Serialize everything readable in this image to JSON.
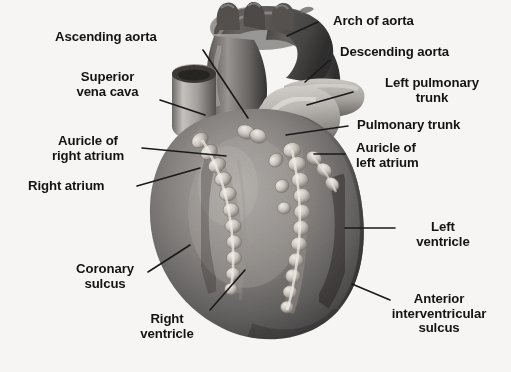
{
  "figure": {
    "style": "grayscale halftone anatomical illustration",
    "background_color": "#f6f5f3",
    "label_color": "#141414",
    "leader_line_color": "#1a1a1a"
  },
  "labels": [
    {
      "id": "ascending-aorta",
      "text": "Ascending aorta",
      "align": "left"
    },
    {
      "id": "superior-vena-cava",
      "text": "Superior\nvena cava",
      "align": "center"
    },
    {
      "id": "auricle-right-atrium",
      "text": "Auricle of\nright atrium",
      "align": "center"
    },
    {
      "id": "right-atrium",
      "text": "Right atrium",
      "align": "left"
    },
    {
      "id": "coronary-sulcus",
      "text": "Coronary\nsulcus",
      "align": "center"
    },
    {
      "id": "right-ventricle",
      "text": "Right\nventricle",
      "align": "center"
    },
    {
      "id": "arch-of-aorta",
      "text": "Arch of aorta",
      "align": "left"
    },
    {
      "id": "descending-aorta",
      "text": "Descending aorta",
      "align": "left"
    },
    {
      "id": "left-pulmonary-trunk",
      "text": "Left pulmonary\ntrunk",
      "align": "center"
    },
    {
      "id": "pulmonary-trunk",
      "text": "Pulmonary trunk",
      "align": "left"
    },
    {
      "id": "auricle-left-atrium",
      "text": "Auricle of\nleft atrium",
      "align": "left"
    },
    {
      "id": "left-ventricle",
      "text": "Left\nventricle",
      "align": "center"
    },
    {
      "id": "anterior-interventricular-sulcus",
      "text": "Anterior\ninterventricular\nsulcus",
      "align": "center"
    }
  ],
  "structures": [
    "aortic-arch",
    "brachiocephalic-branches",
    "ascending-aorta",
    "descending-aorta",
    "superior-vena-cava",
    "pulmonary-trunk",
    "left-pulmonary-artery",
    "right-atrium",
    "right-auricle",
    "left-auricle",
    "right-ventricle",
    "left-ventricle",
    "coronary-sulcus-fat",
    "anterior-interventricular-sulcus-fat",
    "apex"
  ]
}
